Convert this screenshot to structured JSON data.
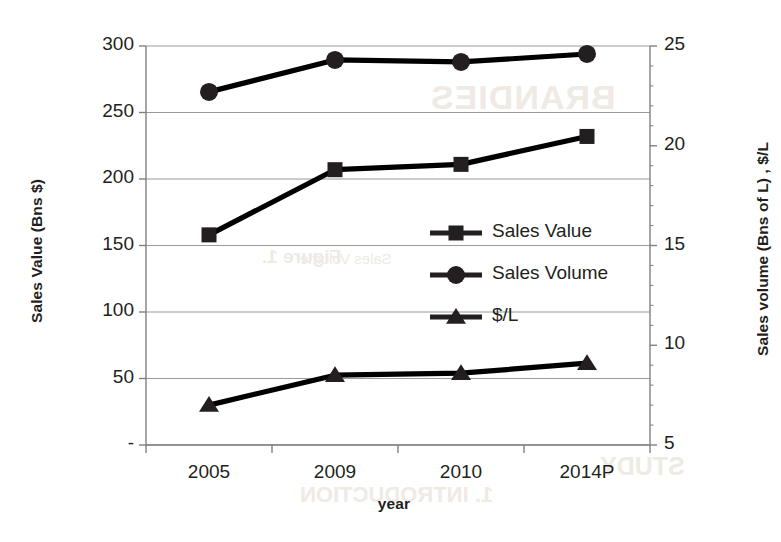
{
  "chart_data": {
    "type": "line",
    "title": "",
    "xlabel": "year",
    "ylabel": "Sales Value (Bns $)",
    "y2label": "Sales volume (Bns of L) , $/L",
    "categories": [
      "2005",
      "2009",
      "2010",
      "2014P"
    ],
    "ylim": [
      0,
      300
    ],
    "yticks": [
      "-",
      "50",
      "100",
      "150",
      "200",
      "250",
      "300"
    ],
    "ytick_values": [
      0,
      50,
      100,
      150,
      200,
      250,
      300
    ],
    "y2lim": [
      5,
      25
    ],
    "y2ticks": [
      "5",
      "10",
      "15",
      "20",
      "25"
    ],
    "y2tick_values": [
      5,
      10,
      15,
      20,
      25
    ],
    "grid": true,
    "legend_position": "center-right-inside",
    "series": [
      {
        "name": "Sales Value",
        "axis": "left",
        "marker": "square",
        "color": "#000000",
        "values": [
          158,
          207,
          211,
          232
        ]
      },
      {
        "name": "Sales Volume",
        "axis": "right",
        "marker": "circle",
        "color": "#000000",
        "values": [
          22.7,
          24.3,
          24.2,
          24.6
        ]
      },
      {
        "name": "$/L",
        "axis": "right",
        "marker": "triangle",
        "color": "#000000",
        "values": [
          7.0,
          8.5,
          8.6,
          9.1
        ]
      }
    ]
  },
  "axes": {
    "left_title": "Sales Value (Bns $)",
    "right_title": "Sales volume (Bns of L) , $/L",
    "x_title": "year",
    "left_ticks": [
      "300",
      "250",
      "200",
      "150",
      "100",
      "50",
      "-"
    ],
    "right_ticks": [
      "25",
      "20",
      "15",
      "10",
      "5"
    ],
    "x_ticks": [
      "2005",
      "2009",
      "2010",
      "2014P"
    ]
  },
  "legend": {
    "items": [
      {
        "label": "Sales Value",
        "marker": "square"
      },
      {
        "label": "Sales Volume",
        "marker": "circle"
      },
      {
        "label": "$/L",
        "marker": "triangle"
      }
    ]
  },
  "bleed_through": {
    "line1": "BRANDIES",
    "line2": "Figure 1.",
    "line3": "Sales Volume",
    "line4": "STUDY",
    "line5": "1. INTRODUCTION"
  },
  "colors": {
    "ink": "#231f20",
    "grid": "#9a9a9a",
    "axis": "#808080",
    "background": "#ffffff"
  }
}
